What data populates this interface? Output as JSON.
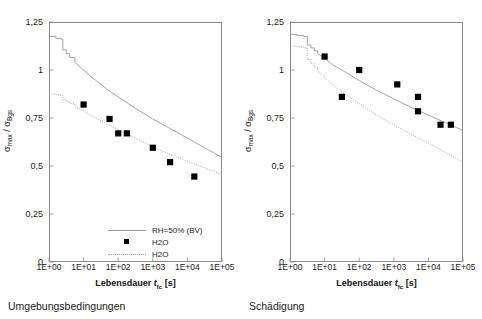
{
  "figure": {
    "panels": [
      {
        "id": "left",
        "caption": "Umgebungsbedingungen",
        "axes": {
          "ytitle_main": "σ",
          "ytitle_sub1": "max",
          "ytitle_mid": " / σ",
          "ytitle_sub2": "Bgs",
          "xtitle_main": "Lebensdauer ",
          "xtitle_italic": "t",
          "xtitle_sub": "fc",
          "xtitle_unit": " [s]",
          "yticks": [
            "0",
            "0,25",
            "0,5",
            "0,75",
            "1",
            "1,25"
          ],
          "yvalues": [
            0,
            0.25,
            0.5,
            0.75,
            1,
            1.25
          ],
          "xticks": [
            "1E+00",
            "1E+01",
            "1E+02",
            "1E+03",
            "1E+04",
            "1E+05"
          ],
          "xvalues": [
            0,
            1,
            2,
            3,
            4,
            5
          ]
        },
        "legend": [
          {
            "label": "RH=50% (BV)",
            "key": "solid-line"
          },
          {
            "label": "H2O",
            "key": "square-marker"
          },
          {
            "label": "H2O",
            "key": "dotted-line"
          }
        ]
      },
      {
        "id": "right",
        "caption": "Schädigung",
        "axes": {
          "ytitle_main": "σ",
          "ytitle_sub1": "max",
          "ytitle_mid": " / σ",
          "ytitle_sub2": "Bgs",
          "xtitle_main": "Lebensdauer ",
          "xtitle_italic": "t",
          "xtitle_sub": "fc",
          "xtitle_unit": " [s]",
          "yticks": [
            "0",
            "0,25",
            "0,5",
            "0,75",
            "1",
            "1,25"
          ],
          "yvalues": [
            0,
            0.25,
            0.5,
            0.75,
            1,
            1.25
          ],
          "xticks": [
            "1E+00",
            "1E+01",
            "1E+02",
            "1E+03",
            "1E+04",
            "1E+05"
          ],
          "xvalues": [
            0,
            1,
            2,
            3,
            4,
            5
          ]
        },
        "legend": [
          {
            "label": "UST (BV)",
            "key": "solid-line"
          },
          {
            "label": "Vickers",
            "key": "dotted-line"
          },
          {
            "label": "Vickers",
            "key": "square-marker"
          }
        ]
      }
    ]
  },
  "chart_data": [
    {
      "type": "line",
      "title": "Umgebungsbedingungen",
      "xlabel": "Lebensdauer t_fc [s]",
      "ylabel": "sigma_max / sigma_Bgs",
      "xscale": "log10",
      "xlim": [
        0,
        5
      ],
      "ylim": [
        0,
        1.25
      ],
      "grid": false,
      "legend_position": "inside-bottom-center",
      "series": [
        {
          "name": "RH=50% (BV)",
          "style": "solid",
          "color": "#9a9a9a",
          "x": [
            0.0,
            0.2,
            0.35,
            0.4,
            0.5,
            0.6,
            0.75,
            1.0,
            1.25,
            1.5,
            1.75,
            2.0,
            2.5,
            3.0,
            3.5,
            4.0,
            4.5,
            5.0
          ],
          "y": [
            1.175,
            1.165,
            1.16,
            1.105,
            1.085,
            1.065,
            1.04,
            1.0,
            0.96,
            0.925,
            0.89,
            0.86,
            0.8,
            0.745,
            0.695,
            0.645,
            0.595,
            0.545
          ]
        },
        {
          "name": "H2O",
          "style": "dotted",
          "color": "#9a9a9a",
          "x": [
            0.0,
            0.2,
            0.3,
            0.4,
            0.5,
            0.6,
            0.75,
            1.0,
            1.25,
            1.5,
            1.75,
            2.0,
            2.5,
            3.0,
            3.5,
            4.0,
            4.5,
            5.0
          ],
          "y": [
            0.875,
            0.872,
            0.868,
            0.845,
            0.835,
            0.825,
            0.81,
            0.785,
            0.76,
            0.735,
            0.71,
            0.69,
            0.645,
            0.6,
            0.56,
            0.525,
            0.49,
            0.455
          ]
        },
        {
          "name": "H2O",
          "style": "markers",
          "marker": "square",
          "color": "#000000",
          "x": [
            1.0,
            1.75,
            2.0,
            2.25,
            3.0,
            3.5,
            4.2
          ],
          "y": [
            0.82,
            0.745,
            0.67,
            0.67,
            0.595,
            0.52,
            0.445
          ]
        }
      ]
    },
    {
      "type": "line",
      "title": "Schädigung",
      "xlabel": "Lebensdauer t_fc [s]",
      "ylabel": "sigma_max / sigma_Bgs",
      "xscale": "log10",
      "xlim": [
        0,
        5
      ],
      "ylim": [
        0,
        1.25
      ],
      "grid": false,
      "legend_position": "inside-bottom-center",
      "series": [
        {
          "name": "UST (BV)",
          "style": "solid",
          "color": "#9a9a9a",
          "x": [
            0.0,
            0.2,
            0.4,
            0.5,
            0.6,
            0.7,
            0.8,
            1.0,
            1.25,
            1.5,
            2.0,
            2.5,
            3.0,
            3.5,
            4.0,
            4.5,
            5.0
          ],
          "y": [
            1.185,
            1.18,
            1.175,
            1.13,
            1.115,
            1.1,
            1.085,
            1.06,
            1.025,
            1.0,
            0.945,
            0.895,
            0.85,
            0.805,
            0.765,
            0.725,
            0.685
          ]
        },
        {
          "name": "Vickers",
          "style": "dotted",
          "color": "#9a9a9a",
          "x": [
            0.0,
            0.2,
            0.4,
            0.5,
            0.6,
            0.7,
            0.8,
            1.0,
            1.25,
            1.5,
            2.0,
            2.5,
            3.0,
            3.5,
            4.0,
            4.5,
            5.0
          ],
          "y": [
            1.125,
            1.12,
            1.115,
            1.055,
            1.035,
            1.015,
            0.995,
            0.96,
            0.92,
            0.885,
            0.825,
            0.765,
            0.715,
            0.665,
            0.62,
            0.57,
            0.52
          ]
        },
        {
          "name": "Vickers",
          "style": "markers",
          "marker": "square",
          "color": "#000000",
          "x": [
            1.0,
            1.5,
            2.0,
            3.1,
            3.7,
            3.7,
            4.35,
            4.65
          ],
          "y": [
            1.07,
            0.86,
            1.0,
            0.925,
            0.86,
            0.785,
            0.715,
            0.715
          ]
        }
      ]
    }
  ]
}
